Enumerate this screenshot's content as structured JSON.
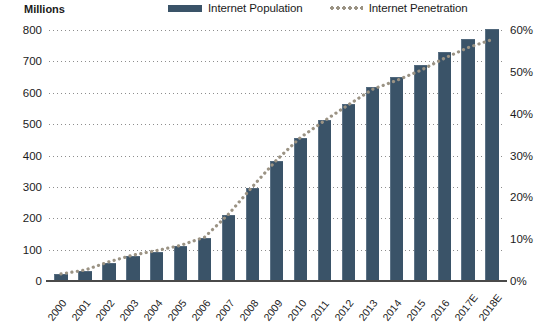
{
  "legend": {
    "entries": [
      {
        "label": "Internet Population",
        "marker": "bar-swatch-icon",
        "color": "#3a5368"
      },
      {
        "label": "Internet Penetration",
        "marker": "dotted-line-swatch-icon",
        "color": "#9b9384"
      }
    ]
  },
  "axes": {
    "left_unit": "Millions",
    "left_ticks": [
      "800",
      "700",
      "600",
      "500",
      "400",
      "300",
      "200",
      "100",
      "0"
    ],
    "right_ticks": [
      "60%",
      "50%",
      "40%",
      "30%",
      "20%",
      "10%",
      "0%"
    ]
  },
  "chart_data": {
    "type": "bar",
    "title": "",
    "xlabel": "",
    "ylabel": "Millions",
    "y2label": "",
    "ylim": [
      0,
      800
    ],
    "y2lim": [
      0,
      60
    ],
    "grid": true,
    "legend_position": "top",
    "categories": [
      "2000",
      "2001",
      "2002",
      "2003",
      "2004",
      "2005",
      "2006",
      "2007",
      "2008",
      "2009",
      "2010",
      "2011",
      "2012",
      "2013",
      "2014",
      "2015",
      "2016",
      "2017E",
      "2018E"
    ],
    "series": [
      {
        "name": "Internet Population",
        "type": "bar",
        "axis": "left",
        "unit": "Millions",
        "color": "#3a5368",
        "values": [
          22,
          33,
          59,
          79,
          94,
          111,
          137,
          210,
          298,
          384,
          457,
          513,
          564,
          618,
          649,
          688,
          731,
          772,
          802
        ]
      },
      {
        "name": "Internet Penetration",
        "type": "line",
        "axis": "right",
        "unit": "%",
        "color": "#9b9384",
        "values": [
          1.7,
          2.6,
          4.6,
          6.2,
          7.3,
          8.5,
          10.5,
          16.0,
          22.6,
          28.9,
          34.3,
          38.3,
          42.1,
          45.8,
          47.9,
          50.3,
          53.2,
          55.8,
          57.7
        ]
      }
    ]
  }
}
